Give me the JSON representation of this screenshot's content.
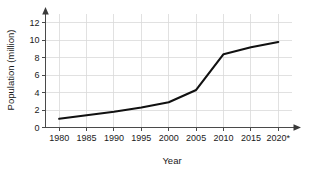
{
  "chart_data": {
    "type": "line",
    "title": "",
    "xlabel": "Year",
    "ylabel": "Population (million)",
    "x": [
      1980,
      1985,
      1990,
      1995,
      2000,
      2005,
      2010,
      2015,
      2020
    ],
    "xtick_labels": [
      "1980",
      "1985",
      "1990",
      "1995",
      "2000",
      "2005",
      "2010",
      "2015",
      "2020*"
    ],
    "values": [
      1.0,
      1.4,
      1.8,
      2.3,
      2.9,
      4.3,
      8.4,
      9.2,
      9.8
    ],
    "ytick_labels": [
      "0",
      "2",
      "4",
      "6",
      "8",
      "10",
      "12"
    ],
    "yticks": [
      0,
      2,
      4,
      6,
      8,
      10,
      12
    ],
    "ylim": [
      0,
      13
    ],
    "xlim": [
      1977.5,
      2022.5
    ],
    "grid": true,
    "legend": "none",
    "series": [
      {
        "name": "Population",
        "values": [
          1.0,
          1.4,
          1.8,
          2.3,
          2.9,
          4.3,
          8.4,
          9.2,
          9.8
        ]
      }
    ],
    "annotations": [
      "* indicates projected/estimated value for 2020"
    ],
    "colors": {
      "line": "#111111",
      "grid": "#d9d9d9",
      "axis": "#4a4a4a",
      "background": "#ffffff",
      "text": "#1a1a1a"
    }
  }
}
